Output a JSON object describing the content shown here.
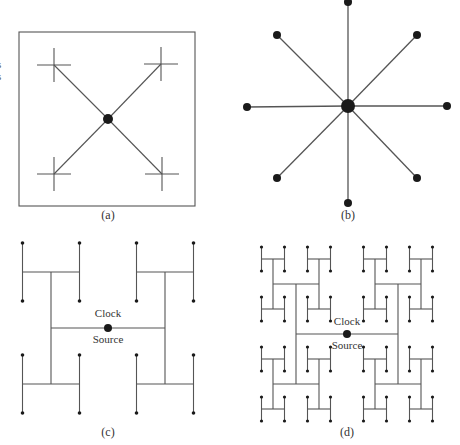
{
  "figure": {
    "colors": {
      "line": "#555555",
      "node": "#1a1a1a",
      "frame": "#555555",
      "text": "#333333"
    },
    "edge_fragment": [
      "s",
      "s"
    ],
    "panels": [
      {
        "id": "a",
        "caption": "(a)",
        "type": "x-tree-in-box",
        "box": {
          "x": 19,
          "y": 32,
          "w": 176,
          "h": 174
        },
        "center": {
          "x": 108,
          "y": 119,
          "r": 5
        },
        "crosses": [
          {
            "x": 54,
            "y": 65
          },
          {
            "x": 161,
            "y": 64
          },
          {
            "x": 54,
            "y": 174
          },
          {
            "x": 162,
            "y": 174
          }
        ],
        "cross_half": 17,
        "caption_pos": {
          "x": 108,
          "y": 219
        }
      },
      {
        "id": "b",
        "caption": "(b)",
        "type": "star",
        "center": {
          "x": 348,
          "y": 106,
          "r": 7
        },
        "leaves": [
          {
            "x": 348,
            "y": 2
          },
          {
            "x": 417,
            "y": 35
          },
          {
            "x": 447,
            "y": 106
          },
          {
            "x": 417,
            "y": 178
          },
          {
            "x": 348,
            "y": 203
          },
          {
            "x": 277,
            "y": 178
          },
          {
            "x": 247,
            "y": 107
          },
          {
            "x": 277,
            "y": 35
          }
        ],
        "leaf_r": 4,
        "caption_pos": {
          "x": 348,
          "y": 219
        }
      },
      {
        "id": "c",
        "caption": "(c)",
        "type": "h-tree",
        "clock_label": [
          "Clock",
          "Source"
        ],
        "center": {
          "x": 108,
          "y": 328,
          "r": 4
        },
        "levels": [
          {
            "hw": 57,
            "hh": 56
          },
          {
            "hw": 28.5,
            "hh": 29
          }
        ],
        "leaf_r": 1.8,
        "clock_text_dy": [
          -11,
          15
        ],
        "caption_pos": {
          "x": 108,
          "y": 436
        }
      },
      {
        "id": "d",
        "caption": "(d)",
        "type": "h-tree",
        "clock_label": [
          "Clock",
          "Source"
        ],
        "center": {
          "x": 347,
          "y": 334,
          "r": 4
        },
        "levels": [
          {
            "hw": 51,
            "hh": 50
          },
          {
            "hw": 23,
            "hh": 25
          },
          {
            "hw": 11.5,
            "hh": 12
          }
        ],
        "leaf_r": 1.6,
        "clock_text_dy": [
          -9,
          15
        ],
        "caption_pos": {
          "x": 347,
          "y": 436
        }
      }
    ]
  }
}
